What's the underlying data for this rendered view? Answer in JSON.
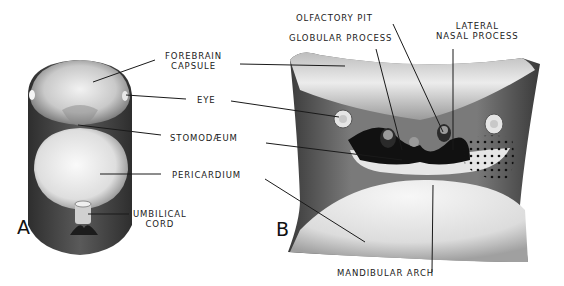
{
  "figure": {
    "panels": [
      {
        "id": "A",
        "letter": "A"
      },
      {
        "id": "B",
        "letter": "B"
      }
    ],
    "labels": {
      "forebrain_capsule_1": "FOREBRAIN",
      "forebrain_capsule_2": "CAPSULE",
      "eye": "EYE",
      "stomodaeum": "STOMODÆUM",
      "pericardium": "PERICARDIUM",
      "umbilical_cord_1": "UMBILICAL",
      "umbilical_cord_2": "CORD",
      "olfactory_pit": "OLFACTORY  PIT",
      "globular_process": "GLOBULAR PROCESS",
      "lateral_nasal_process_1": "LATERAL",
      "lateral_nasal_process_2": "NASAL PROCESS",
      "mandibular_arch": "MANDIBULAR  ARCH"
    },
    "colors": {
      "background": "#ffffff",
      "ink": "#1a1a1a",
      "dark_shade": "#3a3a3a",
      "mid_shade": "#8a8a8a",
      "light_shade": "#dcdcdc"
    }
  }
}
